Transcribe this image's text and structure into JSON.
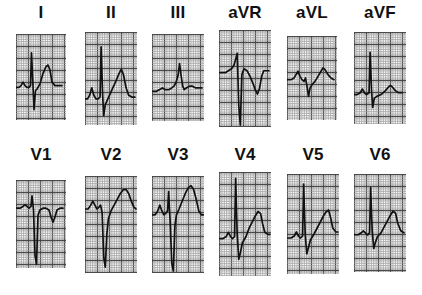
{
  "figure": {
    "kind": "12-lead-electrocardiogram",
    "rows": 2,
    "columns": 6,
    "background_color": "#ffffff",
    "grid_minor_color": "#9a9a9a",
    "grid_major_color": "#4a4a4a",
    "trace_color": "#111111",
    "grid_minor_px": 2.4,
    "grid_major_every": 5
  },
  "chart_data": {
    "type": "line",
    "title": "",
    "xlabel": "",
    "ylabel": "",
    "grid": true,
    "legend": "none",
    "series": [
      {
        "name": "I",
        "label": "I",
        "row": 0,
        "col": 0,
        "panel": {
          "x": 16,
          "y": 34,
          "w": 50,
          "h": 86
        },
        "label_pos": {
          "x": 41,
          "y": 4
        },
        "baseline": 0.62,
        "points": "0,62 6,62 10,60 14,56 18,60 22,62 26,62 29,60 31,22 34,60 36,88 39,66 42,64 48,58 54,46 60,38 64,36 68,42 72,56 78,60 86,60 92,60"
      },
      {
        "name": "II",
        "label": "II",
        "row": 0,
        "col": 1,
        "panel": {
          "x": 85,
          "y": 32,
          "w": 52,
          "h": 93
        },
        "label_pos": {
          "x": 111,
          "y": 4
        },
        "baseline": 0.72,
        "points": "0,72 5,72 9,68 13,60 17,68 21,72 25,72 29,70 31,16 34,68 36,90 39,78 44,72 52,62 60,52 66,44 70,40 74,46 79,60 84,68 90,70 96,70"
      },
      {
        "name": "III",
        "label": "III",
        "row": 0,
        "col": 2,
        "panel": {
          "x": 152,
          "y": 34,
          "w": 52,
          "h": 87
        },
        "label_pos": {
          "x": 178,
          "y": 4
        },
        "baseline": 0.64,
        "points": "0,66 8,66 14,64 20,62 26,64 32,64 38,62 42,60 46,56 50,48 53,34 56,48 59,60 62,64 66,62 72,60 78,60 84,62 90,62 96,62"
      },
      {
        "name": "aVR",
        "label": "aVR",
        "row": 0,
        "col": 3,
        "panel": {
          "x": 219,
          "y": 30,
          "w": 52,
          "h": 97
        },
        "label_pos": {
          "x": 245,
          "y": 4
        },
        "baseline": 0.42,
        "points": "0,44 6,44 12,44 18,42 24,40 29,36 32,30 35,24 38,78 41,98 44,46 48,40 54,42 60,48 66,56 70,62 74,66 78,60 82,48 86,42 92,42 96,42"
      },
      {
        "name": "aVL",
        "label": "aVL",
        "row": 0,
        "col": 4,
        "panel": {
          "x": 287,
          "y": 36,
          "w": 50,
          "h": 84
        },
        "label_pos": {
          "x": 312,
          "y": 4
        },
        "baseline": 0.5,
        "points": "0,52 8,52 14,50 18,46 22,42 26,48 30,52 34,54 37,50 40,60 43,72 46,62 50,58 56,54 62,48 68,42 72,38 76,40 82,46 88,50 94,52"
      },
      {
        "name": "aVF",
        "label": "aVF",
        "row": 0,
        "col": 5,
        "panel": {
          "x": 354,
          "y": 32,
          "w": 52,
          "h": 92
        },
        "label_pos": {
          "x": 380,
          "y": 4
        },
        "baseline": 0.66,
        "points": "0,68 6,68 12,66 16,62 20,66 24,68 29,66 31,22 34,66 36,82 39,72 44,70 52,68 60,64 66,60 70,58 74,60 80,64 86,66 92,66"
      },
      {
        "name": "V1",
        "label": "V1",
        "row": 1,
        "col": 0,
        "panel": {
          "x": 16,
          "y": 180,
          "w": 50,
          "h": 88
        },
        "label_pos": {
          "x": 41,
          "y": 146
        },
        "baseline": 0.3,
        "points": "0,32 8,32 14,30 18,28 22,30 26,32 30,30 32,18 35,34 38,86 41,96 44,40 48,34 54,32 60,32 66,34 70,42 74,48 78,42 82,34 88,32 94,32"
      },
      {
        "name": "V2",
        "label": "V2",
        "row": 1,
        "col": 1,
        "panel": {
          "x": 85,
          "y": 176,
          "w": 52,
          "h": 97
        },
        "label_pos": {
          "x": 111,
          "y": 146
        },
        "baseline": 0.3,
        "points": "0,34 6,34 11,30 15,26 19,30 23,34 27,32 30,30 33,38 36,84 39,94 42,60 45,44 50,36 56,30 62,24 68,18 74,14 79,14 84,18 89,26 94,32 98,34"
      },
      {
        "name": "V3",
        "label": "V3",
        "row": 1,
        "col": 2,
        "panel": {
          "x": 152,
          "y": 176,
          "w": 52,
          "h": 97
        },
        "label_pos": {
          "x": 178,
          "y": 146
        },
        "baseline": 0.36,
        "points": "0,40 6,40 11,36 15,30 19,36 23,40 27,38 30,36 32,16 35,48 38,90 41,98 44,52 47,40 52,34 58,26 64,18 70,12 75,10 80,14 85,24 90,36 95,40 99,40"
      },
      {
        "name": "V4",
        "label": "V4",
        "row": 1,
        "col": 3,
        "panel": {
          "x": 219,
          "y": 172,
          "w": 52,
          "h": 104
        },
        "label_pos": {
          "x": 245,
          "y": 146
        },
        "baseline": 0.62,
        "points": "0,64 8,64 14,62 18,58 22,62 26,64 30,62 32,6 35,60 38,84 41,78 45,68 52,62 58,54 64,48 70,42 75,38 80,40 84,50 88,58 94,60 98,60"
      },
      {
        "name": "V5",
        "label": "V5",
        "row": 1,
        "col": 4,
        "panel": {
          "x": 287,
          "y": 174,
          "w": 52,
          "h": 100
        },
        "label_pos": {
          "x": 312,
          "y": 146
        },
        "baseline": 0.62,
        "points": "0,64 8,64 14,62 18,58 22,62 26,64 30,62 32,10 35,60 38,80 41,74 45,66 52,60 58,54 64,48 70,42 75,38 80,36 84,44 88,54 94,58 98,58"
      },
      {
        "name": "V6",
        "label": "V6",
        "row": 1,
        "col": 5,
        "panel": {
          "x": 354,
          "y": 174,
          "w": 52,
          "h": 98
        },
        "label_pos": {
          "x": 380,
          "y": 146
        },
        "baseline": 0.6,
        "points": "0,62 8,62 14,60 18,58 22,60 26,62 30,60 32,14 35,58 38,76 41,70 45,64 52,60 58,54 64,48 70,42 75,38 80,40 84,50 90,58 96,60"
      }
    ]
  }
}
